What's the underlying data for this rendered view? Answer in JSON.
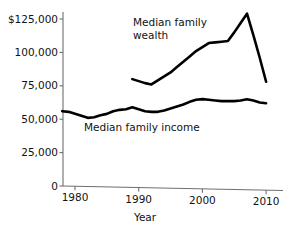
{
  "chart_data": {
    "type": "line",
    "title": "",
    "xlabel": "Year",
    "ylabel": "",
    "xlim": [
      1978,
      2011
    ],
    "ylim": [
      0,
      132000
    ],
    "grid": false,
    "legend_position": "inline-annotations",
    "xticks": [
      "1980",
      "1990",
      "2000",
      "2010"
    ],
    "xtick_values": [
      1980,
      1990,
      2000,
      2010
    ],
    "yticks": [
      "$125,000",
      "100,000",
      "75,000",
      "50,000",
      "25,000",
      "0"
    ],
    "ytick_values": [
      125000,
      100000,
      75000,
      50000,
      25000,
      0
    ],
    "series": [
      {
        "name": "Median family wealth",
        "annotation": "Median family\nwealth",
        "color": "#000000",
        "x": [
          1989,
          1990,
          1991,
          1992,
          1993,
          1994,
          1995,
          1996,
          1997,
          1998,
          1999,
          2000,
          2001,
          2002,
          2003,
          2004,
          2005,
          2006,
          2007,
          2008,
          2009,
          2010
        ],
        "values": [
          80000,
          78500,
          77000,
          76000,
          79000,
          82000,
          85000,
          89000,
          93000,
          97000,
          101000,
          104000,
          107000,
          107500,
          108000,
          108500,
          115000,
          122000,
          129000,
          113000,
          96000,
          78000
        ]
      },
      {
        "name": "Median family income",
        "annotation": "Median family income",
        "color": "#000000",
        "x": [
          1978,
          1979,
          1980,
          1981,
          1982,
          1983,
          1984,
          1985,
          1986,
          1987,
          1988,
          1989,
          1990,
          1991,
          1992,
          1993,
          1994,
          1995,
          1996,
          1997,
          1998,
          1999,
          2000,
          2001,
          2002,
          2003,
          2004,
          2005,
          2006,
          2007,
          2008,
          2009,
          2010
        ],
        "values": [
          56000,
          55500,
          54000,
          52500,
          51000,
          51500,
          53000,
          54000,
          56000,
          57000,
          57500,
          59000,
          57500,
          56000,
          55500,
          55500,
          56500,
          58000,
          59500,
          61000,
          63000,
          64500,
          65000,
          64500,
          64000,
          63500,
          63500,
          63500,
          64000,
          65000,
          64000,
          62500,
          62000
        ]
      }
    ],
    "axis_color": "#6e6e6e",
    "line_color": "#000000",
    "background": "#ffffff"
  }
}
